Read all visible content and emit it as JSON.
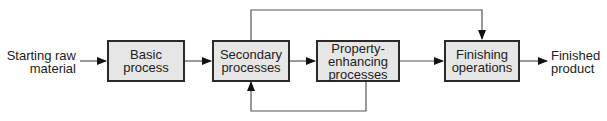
{
  "diagram": {
    "input": {
      "line1": "Starting raw",
      "line2": "material"
    },
    "output": {
      "line1": "Finished",
      "line2": "product"
    },
    "boxes": [
      {
        "line1": "Basic",
        "line2": "process"
      },
      {
        "line1": "Secondary",
        "line2": "processes"
      },
      {
        "line1": "Property-enhancing",
        "line2": "processes"
      },
      {
        "line1": "Finishing",
        "line2": "operations"
      }
    ],
    "edges": [
      {
        "from": "Starting raw material",
        "to": "Basic process"
      },
      {
        "from": "Basic process",
        "to": "Secondary processes"
      },
      {
        "from": "Secondary processes",
        "to": "Property-enhancing processes"
      },
      {
        "from": "Property-enhancing processes",
        "to": "Finishing operations"
      },
      {
        "from": "Finishing operations",
        "to": "Finished product"
      },
      {
        "from": "Secondary processes",
        "to": "Finishing operations",
        "route": "top-bypass"
      },
      {
        "from": "Property-enhancing processes",
        "to": "Secondary processes",
        "route": "bottom-feedback"
      }
    ],
    "colors": {
      "box_fill": "#e6e6e6",
      "box_border": "#2a2a2a",
      "line": "#555555",
      "arrowhead": "#111111"
    }
  }
}
